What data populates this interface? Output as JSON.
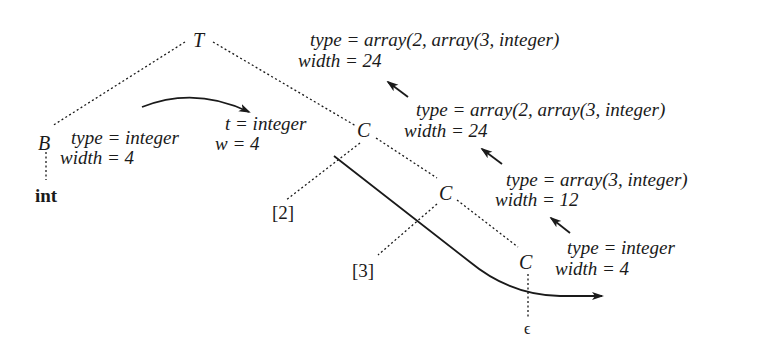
{
  "diagram": {
    "nodes": {
      "root": "T",
      "basic": "B",
      "basic_child": "int",
      "c1": "C",
      "c2": "C",
      "c3": "C",
      "dim1": "[2]",
      "dim2": "[3]",
      "epsilon": "ϵ"
    },
    "annotations": {
      "root_type": "type = array(2, array(3, integer)",
      "root_width": "width = 24",
      "b_type": "type = integer",
      "b_width": "width = 4",
      "inherited_t": "t = integer",
      "inherited_w": "w = 4",
      "c1_type": "type = array(2, array(3, integer)",
      "c1_width": "width = 24",
      "c2_type": "type = array(3, integer)",
      "c2_width": "width = 12",
      "c3_type": "type = integer",
      "c3_width": "width = 4"
    },
    "colors": {
      "ink": "#1a1a1a",
      "background": "#ffffff"
    }
  }
}
